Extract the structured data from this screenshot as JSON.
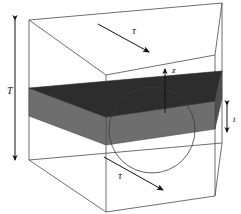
{
  "figure": {
    "type": "3d-schematic-diagram",
    "background_color": "#ffffff",
    "line_color": "#4a4a4a",
    "arrow_color": "#111111",
    "slab_top_color": "#2d2d2d",
    "slab_front_color": "#6e6e6e",
    "slab_right_color": "#4f4f4f",
    "circle_color": "#3b3b3b"
  },
  "labels": {
    "total_thickness": "T",
    "layer_thickness": "t",
    "shear_top": "τ",
    "shear_bottom": "τ",
    "vertical_axis": "z"
  },
  "annotations": [
    {
      "name": "total-thickness-dimension",
      "symbol": "T",
      "kind": "double-headed-dimension-arrow",
      "orientation": "vertical",
      "side": "left"
    },
    {
      "name": "layer-thickness-dimension",
      "symbol": "t",
      "kind": "double-headed-dimension-arrow",
      "orientation": "vertical",
      "side": "right"
    },
    {
      "name": "shear-stress-top",
      "symbol": "τ",
      "kind": "single-headed-arrow",
      "direction": "down-right",
      "surface": "top"
    },
    {
      "name": "shear-stress-bottom",
      "symbol": "τ",
      "kind": "single-headed-arrow",
      "direction": "down-right",
      "surface": "bottom"
    },
    {
      "name": "z-axis",
      "symbol": "z",
      "kind": "single-headed-arrow",
      "direction": "up",
      "surface": "layer-top"
    }
  ]
}
